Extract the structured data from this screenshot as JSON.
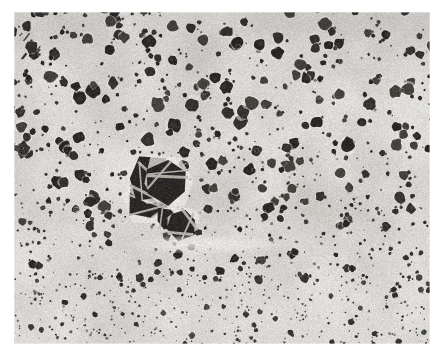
{
  "figure": {
    "kind": "micrograph",
    "alt_text": "Grayscale electron micrograph of a two-phase microstructure: dark irregular rounded particles dispersed in a light gray matrix, with particle size decreasing toward the bottom of the field.",
    "caption": "",
    "title": "",
    "has_scale_bar": false,
    "has_label_text": false,
    "background_color": "#ffffff"
  },
  "plate": {
    "x": 14,
    "y": 12,
    "width": 416,
    "height": 332,
    "matrix_color": "#d8d6d2",
    "matrix_color_light": "#e9e7e3",
    "matrix_color_dark": "#c2c0bb",
    "particle_color": "#2b2927",
    "particle_color_light": "#46433f",
    "particle_color_mid": "#353331",
    "facet_highlight_color": "#b9b6b0",
    "grain_amount": 0.17,
    "vignette_strength": 0.2
  },
  "structure": {
    "description": "two-phase particulate microstructure",
    "phase_dark_label": "dark dispersed particles",
    "phase_light_label": "light matrix",
    "size_gradient": "coarse at top, fine at bottom",
    "area_fraction_dark": 0.46,
    "bands": [
      {
        "name": "top-coarse",
        "y_from": 0.0,
        "y_to": 0.2,
        "radius_min": 4.0,
        "radius_max": 13.0,
        "density": 0.0058,
        "fines": 0.55
      },
      {
        "name": "upper-mid",
        "y_from": 0.2,
        "y_to": 0.42,
        "radius_min": 4.5,
        "radius_max": 14.5,
        "density": 0.0055,
        "fines": 0.52
      },
      {
        "name": "center",
        "y_from": 0.42,
        "y_to": 0.6,
        "radius_min": 4.0,
        "radius_max": 13.0,
        "density": 0.0056,
        "fines": 0.56
      },
      {
        "name": "lower-mid",
        "y_from": 0.6,
        "y_to": 0.8,
        "radius_min": 3.2,
        "radius_max": 10.0,
        "density": 0.007,
        "fines": 0.62
      },
      {
        "name": "bottom-fine",
        "y_from": 0.8,
        "y_to": 1.0,
        "radius_min": 2.0,
        "radius_max": 6.5,
        "density": 0.0115,
        "fines": 0.74
      }
    ],
    "fine_speckle_density": 0.03,
    "fine_speckle_radius_min": 0.8,
    "fine_speckle_radius_max": 2.6
  },
  "features": [
    {
      "name": "faceted-crystal-cluster",
      "cx": 0.345,
      "cy": 0.545,
      "rx": 0.075,
      "ry": 0.095,
      "note": "angular faceted particles with bright linear facet highlights near center-left"
    },
    {
      "name": "secondary-faceted-grain",
      "cx": 0.395,
      "cy": 0.615,
      "rx": 0.048,
      "ry": 0.055,
      "note": "smaller angular grain below main cluster"
    },
    {
      "name": "bright-matrix-channel",
      "cx": 0.47,
      "cy": 0.7,
      "rx": 0.21,
      "ry": 0.03,
      "note": "horizontal particle-free light band across lower middle"
    },
    {
      "name": "upper-left-streak",
      "cx": 0.022,
      "cy": 0.12,
      "rx": 0.03,
      "ry": 0.04,
      "note": "dark diagonal scratch/streak artifact at far left edge"
    }
  ],
  "render": {
    "seed": 20240517,
    "supersample": 2
  }
}
